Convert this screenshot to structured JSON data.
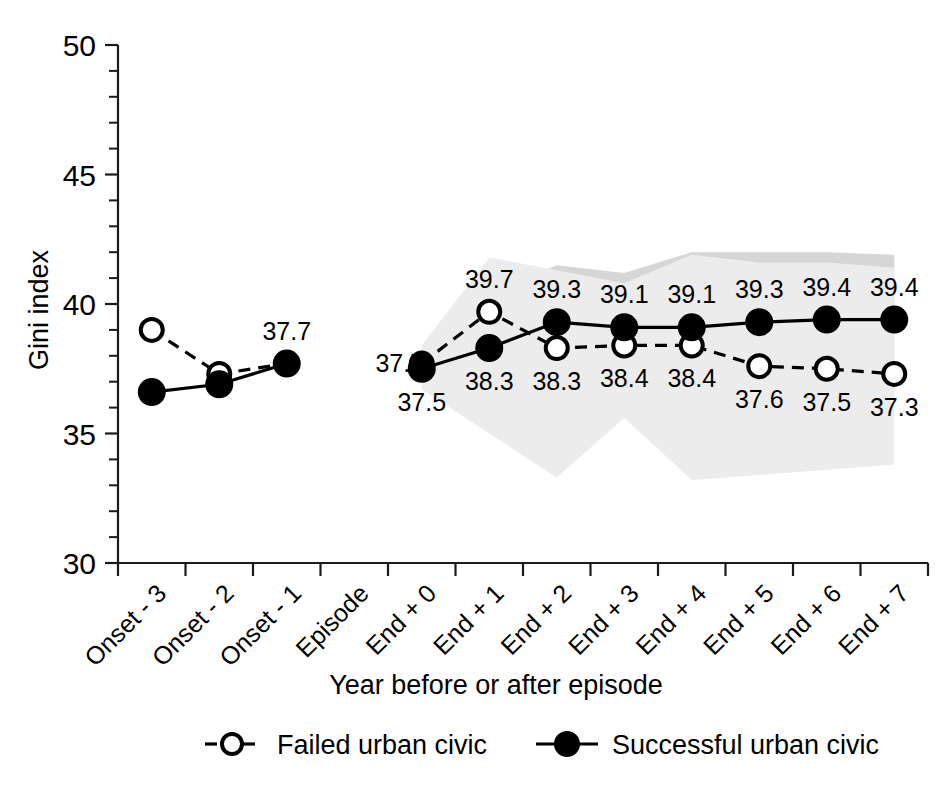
{
  "chart_data": {
    "type": "line",
    "title": "",
    "xlabel": "Year before or after episode",
    "ylabel": "Gini index",
    "ylim": [
      30,
      50
    ],
    "ytick_labels": [
      "50",
      "45",
      "40",
      "35",
      "30"
    ],
    "ytick_values": [
      50,
      45,
      40,
      35,
      30
    ],
    "yminor_step": 1,
    "grid": false,
    "legend_position": "bottom",
    "categories": [
      "Onset - 3",
      "Onset - 2",
      "Onset - 1",
      "Episode",
      "End + 0",
      "End + 1",
      "End + 2",
      "End + 3",
      "End + 4",
      "End + 5",
      "End + 6",
      "End + 7"
    ],
    "series": [
      {
        "name": "Failed urban civic",
        "marker": "open-circle",
        "line": "dashed",
        "values": [
          39.0,
          37.3,
          37.7,
          null,
          37.7,
          39.7,
          38.3,
          38.4,
          38.4,
          37.6,
          37.5,
          37.3
        ],
        "labels": [
          null,
          null,
          null,
          null,
          "37.7",
          "39.7",
          "38.3",
          "38.4",
          "38.4",
          "37.6",
          "37.5",
          "37.3"
        ],
        "label_side": [
          "above",
          "above",
          "above",
          null,
          "left",
          "above",
          "below",
          "below",
          "below",
          "below",
          "below",
          "below"
        ]
      },
      {
        "name": "Successful urban civic",
        "marker": "filled-circle",
        "line": "solid",
        "values": [
          36.6,
          36.9,
          37.7,
          null,
          37.5,
          38.3,
          39.3,
          39.1,
          39.1,
          39.3,
          39.4,
          39.4
        ],
        "labels": [
          null,
          null,
          "37.7",
          null,
          "37.5",
          "38.3",
          "39.3",
          "39.1",
          "39.1",
          "39.3",
          "39.4",
          "39.4"
        ],
        "label_side": [
          null,
          null,
          "above",
          null,
          "below",
          "below",
          "above",
          "above",
          "above",
          "above",
          "above",
          "above"
        ]
      }
    ],
    "confidence_bands": [
      {
        "name": "successful-band",
        "shade": "#d6d6d6",
        "x_start_index": 4,
        "upper": [
          38.0,
          40.4,
          41.5,
          41.2,
          42.0,
          42.0,
          42.0,
          41.9
        ],
        "lower": [
          37.0,
          36.0,
          35.6,
          36.2,
          36.2,
          36.2,
          36.3,
          36.3
        ]
      },
      {
        "name": "failed-band",
        "shade": "#ececec",
        "x_start_index": 4,
        "upper": [
          38.4,
          41.8,
          41.3,
          40.8,
          41.9,
          41.6,
          41.6,
          41.4
        ],
        "lower": [
          36.7,
          35.0,
          33.3,
          35.6,
          33.2,
          33.4,
          33.6,
          33.8
        ]
      }
    ],
    "legend": [
      {
        "label": "Failed urban civic",
        "marker": "open-circle",
        "line": "dashed"
      },
      {
        "label": "Successful urban civic",
        "marker": "filled-circle",
        "line": "solid"
      }
    ]
  }
}
